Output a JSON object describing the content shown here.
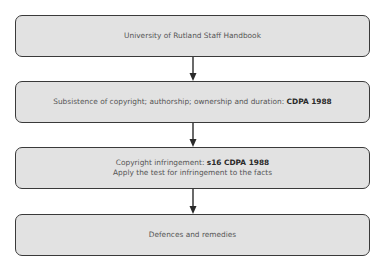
{
  "diagram": {
    "type": "flowchart",
    "direction": "top-to-bottom",
    "colors": {
      "box_fill": "#e2e2e2",
      "box_border": "#3a3a3a",
      "text": "#555555",
      "bold_text": "#2a2a2a",
      "arrow": "#2a2a2a"
    },
    "nodes": [
      {
        "id": "handbook",
        "lines": [
          {
            "text": "University of Rutland Staff Handbook",
            "bold": ""
          }
        ]
      },
      {
        "id": "subsistence",
        "lines": [
          {
            "text": "Subsistence of copyright;  authorship; ownership and duration: ",
            "bold": "CDPA 1988"
          }
        ]
      },
      {
        "id": "infringement",
        "lines": [
          {
            "text": "Copyright infringement: ",
            "bold": "s16 CDPA 1988"
          },
          {
            "text": "Apply the test for infringement to the facts",
            "bold": ""
          }
        ]
      },
      {
        "id": "defences",
        "lines": [
          {
            "text": "Defences and remedies",
            "bold": ""
          }
        ]
      }
    ],
    "edges": [
      {
        "from": "handbook",
        "to": "subsistence"
      },
      {
        "from": "subsistence",
        "to": "infringement"
      },
      {
        "from": "infringement",
        "to": "defences"
      }
    ]
  }
}
